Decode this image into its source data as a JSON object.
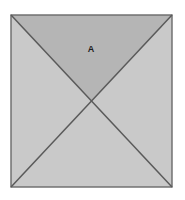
{
  "figure": {
    "type": "geometric-diagram",
    "background_color": "#ffffff",
    "canvas": {
      "width": 185,
      "height": 200
    }
  },
  "square": {
    "name": "outer-square",
    "left": 11,
    "top": 15,
    "right": 172,
    "bottom": 187,
    "width": 161,
    "height": 172,
    "stroke_color": "#6a6a6a",
    "stroke_width": 1.4,
    "corners": {
      "top_left": [
        11,
        15
      ],
      "top_right": [
        172,
        15
      ],
      "bottom_right": [
        172,
        187
      ],
      "bottom_left": [
        11,
        187
      ]
    }
  },
  "center_point": {
    "name": "diagonal-intersection",
    "x": 91.5,
    "y": 101
  },
  "diagonals": [
    {
      "name": "diagonal-tl-br",
      "from": [
        11,
        15
      ],
      "to": [
        172,
        187
      ],
      "stroke_color": "#5a5a5a",
      "stroke_width": 1.5
    },
    {
      "name": "diagonal-tr-bl",
      "from": [
        172,
        15
      ],
      "to": [
        11,
        187
      ],
      "stroke_color": "#5a5a5a",
      "stroke_width": 1.5
    }
  ],
  "regions": [
    {
      "id": "top",
      "name": "triangle-top",
      "label": "A",
      "label_x": 91,
      "label_y": 50,
      "fill_color": "#b5b5b5",
      "points": "11,15 172,15 91.5,101"
    },
    {
      "id": "right",
      "name": "triangle-right",
      "label": "",
      "fill_color": "#c9c9c9",
      "points": "172,15 172,187 91.5,101"
    },
    {
      "id": "bottom",
      "name": "triangle-bottom",
      "label": "",
      "fill_color": "#c9c9c9",
      "points": "172,187 11,187 91.5,101"
    },
    {
      "id": "left",
      "name": "triangle-left",
      "label": "",
      "fill_color": "#c9c9c9",
      "points": "11,187 11,15 91.5,101"
    }
  ],
  "labels": {
    "region_a": "A"
  }
}
